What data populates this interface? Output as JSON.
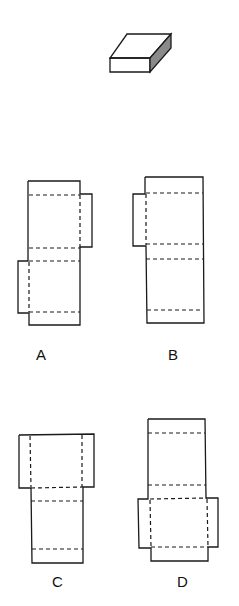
{
  "figure": {
    "object": "flat rectangular box (3D)",
    "side_face_color": "#8a8a8a",
    "options": [
      {
        "id": "A",
        "label": "A"
      },
      {
        "id": "B",
        "label": "B"
      },
      {
        "id": "C",
        "label": "C"
      },
      {
        "id": "D",
        "label": "D"
      }
    ]
  }
}
